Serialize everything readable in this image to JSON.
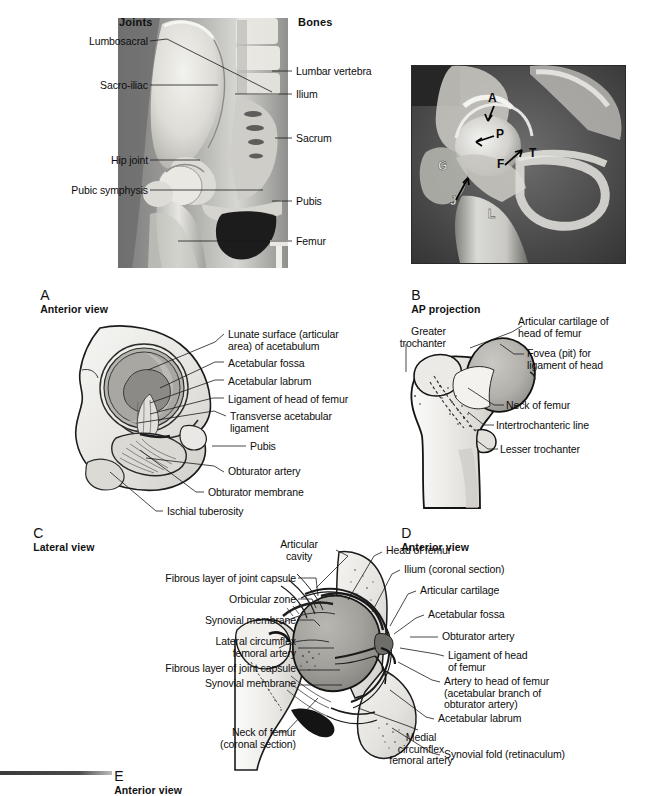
{
  "figure": {
    "columns": {
      "left_header": "Joints",
      "right_header": "Bones"
    }
  },
  "panels": [
    {
      "id": "A",
      "letter": "A",
      "caption": "Anterior view",
      "type": "radiograph-overlay",
      "labels_left": [
        {
          "text": "Lumbosacral"
        },
        {
          "text": "Sacro-iliac"
        },
        {
          "text": "Hip joint"
        },
        {
          "text": "Pubic symphysis"
        }
      ],
      "labels_right": [
        {
          "text": "Lumbar vertebra"
        },
        {
          "text": "Ilium"
        },
        {
          "text": "Sacrum"
        },
        {
          "text": "Pubis"
        },
        {
          "text": "Femur"
        }
      ]
    },
    {
      "id": "B",
      "letter": "B",
      "caption": "AP projection",
      "type": "radiograph",
      "markers": [
        {
          "text": "A"
        },
        {
          "text": "P"
        },
        {
          "text": "F"
        },
        {
          "text": "T"
        },
        {
          "text": "G"
        },
        {
          "text": "J"
        },
        {
          "text": "L"
        }
      ]
    },
    {
      "id": "C",
      "letter": "C",
      "caption": "Lateral view",
      "type": "line-drawing",
      "labels": [
        {
          "text": "Lunate surface (articular\narea) of acetabulum"
        },
        {
          "text": "Acetabular fossa"
        },
        {
          "text": "Acetabular labrum"
        },
        {
          "text": "Ligament of head of femur"
        },
        {
          "text": "Transverse acetabular\nligament"
        },
        {
          "text": "Pubis"
        },
        {
          "text": "Obturator artery"
        },
        {
          "text": "Obturator membrane"
        },
        {
          "text": "Ischial tuberosity"
        }
      ]
    },
    {
      "id": "D",
      "letter": "D",
      "caption": "Anterior view",
      "type": "line-drawing",
      "labels_left": [
        {
          "text": "Greater\ntrochanter"
        }
      ],
      "labels_right": [
        {
          "text": "Articular cartilage of\nhead of femur"
        },
        {
          "text": "Fovea (pit) for\nligament of head"
        },
        {
          "text": "Neck of femur"
        },
        {
          "text": "Intertrochanteric line"
        },
        {
          "text": "Lesser trochanter"
        }
      ]
    },
    {
      "id": "E",
      "letter": "E",
      "caption": "Anterior view",
      "type": "line-drawing",
      "labels_top": [
        {
          "text": "Articular\ncavity"
        }
      ],
      "labels_left": [
        {
          "text": "Fibrous layer of joint capsule"
        },
        {
          "text": "Orbicular zone"
        },
        {
          "text": "Synovial membrane"
        },
        {
          "text": "Lateral circumflex\nfemoral artery"
        },
        {
          "text": "Fibrous layer of joint capsule"
        },
        {
          "text": "Synovial membrane"
        },
        {
          "text": "Neck of femur\n(coronal section)"
        }
      ],
      "labels_right": [
        {
          "text": "Head of femur"
        },
        {
          "text": "Ilium (coronal section)"
        },
        {
          "text": "Articular cartilage"
        },
        {
          "text": "Acetabular fossa"
        },
        {
          "text": "Obturator artery"
        },
        {
          "text": "Ligament of head\nof femur"
        },
        {
          "text": "Artery to head of femur\n(acetabular branch of\nobturator artery)"
        },
        {
          "text": "Acetabular labrum"
        },
        {
          "text": "Synovial fold (retinaculum)"
        }
      ],
      "labels_bottom": [
        {
          "text": "Medial\ncircumflex\nfemoral artery"
        }
      ]
    }
  ],
  "colors": {
    "ink": "#111111",
    "bone_fill": "#ededea",
    "cartilage_fill": "#a8a8a4",
    "shadow": "#8d8d8a",
    "leader": "#1a1a1a",
    "xray_bg": "#2a2a2a"
  }
}
